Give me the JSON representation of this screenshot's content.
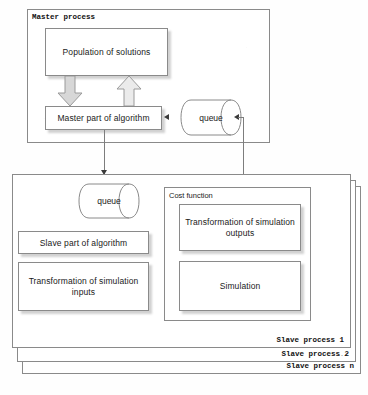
{
  "diagram": {
    "title_master": "Master process",
    "master": {
      "population_box": "Population of solutions",
      "algorithm_box": "Master part of algorithm",
      "queue": "queue",
      "arrow_down_name": "population-to-algorithm-arrow",
      "arrow_up_name": "algorithm-to-population-arrow"
    },
    "slave": {
      "queue": "queue",
      "algorithm_box": "Slave part of algorithm",
      "transform_inputs_box": "Transformation of simulation inputs",
      "cost_function_title": "Cost function",
      "transform_outputs_box": "Transformation of simulation outputs",
      "simulation_box": "Simulation",
      "captions": [
        "Slave process 1",
        "Slave process 2",
        "Slave process n"
      ],
      "ellipsis": "..."
    },
    "colors": {
      "stroke": "#8a8a8a",
      "arrow_fill_dark": "#d9d9d9",
      "arrow_fill_light": "#e9e9e9",
      "arrow_stroke": "#9a9a9a",
      "connector": "#7d7d7d",
      "text": "#1a1a1a",
      "background": "#fefefe"
    }
  }
}
